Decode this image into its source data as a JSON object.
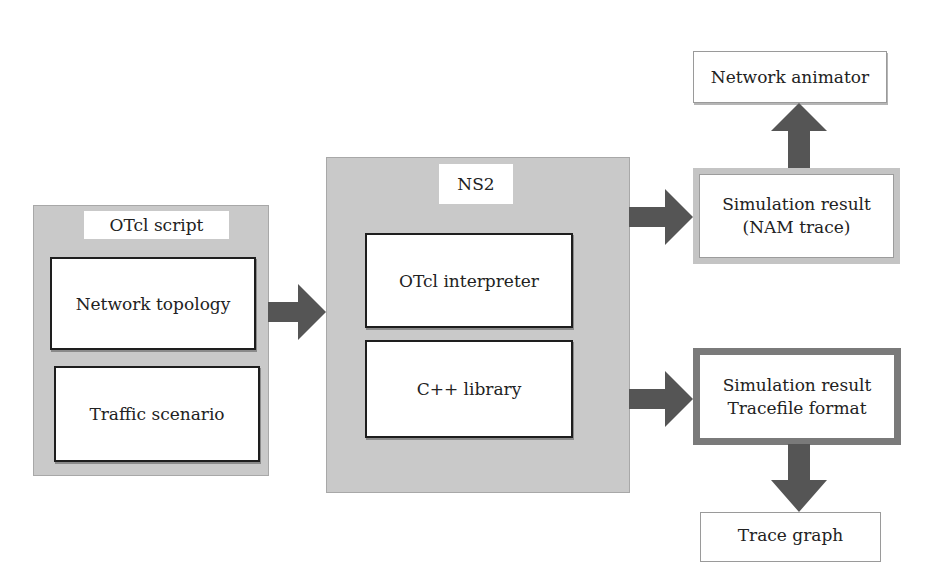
{
  "diagram": {
    "otcl_script": {
      "title": "OTcl script",
      "items": [
        "Network topology",
        "Traffic scenario"
      ]
    },
    "ns2": {
      "title": "NS2",
      "items": [
        "OTcl interpreter",
        "C++ library"
      ]
    },
    "nam_result": {
      "line1": "Simulation result",
      "line2": "(NAM trace)"
    },
    "network_animator": "Network animator",
    "trace_result": {
      "line1": "Simulation result",
      "line2": "Tracefile format"
    },
    "trace_graph": "Trace graph"
  }
}
